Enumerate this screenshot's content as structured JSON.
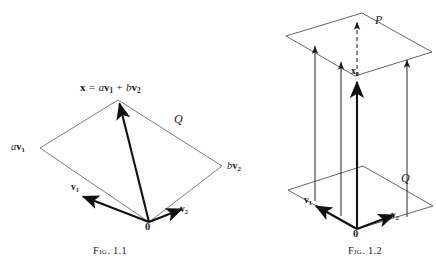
{
  "page": {
    "kind": "mathematical-figure-pair",
    "background_color": "#fefefe",
    "ink_color": "#1a1a1a",
    "width": 436,
    "height": 272
  },
  "figure1": {
    "caption": "Fig. 1.1",
    "caption_prefix": "Fig.",
    "caption_number": "1.1",
    "equation": {
      "lhs": "x",
      "equals": "=",
      "term1_scalar": "a",
      "term1_vector": "v",
      "term1_sub": "1",
      "plus": "+",
      "term2_scalar": "b",
      "term2_vector": "v",
      "term2_sub": "2",
      "full_text": "x = av1 + bv2"
    },
    "labels": {
      "av1_scalar": "a",
      "av1_vector": "v",
      "av1_sub": "1",
      "bv2_scalar": "b",
      "bv2_vector": "v",
      "bv2_sub": "2",
      "v1_vector": "v",
      "v1_sub": "1",
      "v2_vector": "v",
      "v2_sub": "2",
      "origin": "0",
      "plane": "Q"
    }
  },
  "figure2": {
    "caption": "Fig. 1.2",
    "caption_prefix": "Fig.",
    "caption_number": "1.2",
    "labels": {
      "top_plane": "P",
      "bottom_plane": "Q",
      "x0_vector": "x",
      "x0_sub": "0",
      "v1_vector": "v",
      "v1_sub": "1",
      "v2_vector": "v",
      "v2_sub": "2",
      "origin": "0"
    }
  }
}
